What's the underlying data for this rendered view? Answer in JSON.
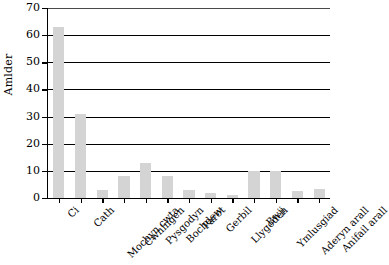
{
  "chart_data": {
    "type": "bar",
    "title": "",
    "xlabel": "",
    "ylabel": "Amlder",
    "ylim": [
      0,
      70
    ],
    "yticks": [
      0,
      10,
      20,
      30,
      40,
      50,
      60,
      70
    ],
    "grid": true,
    "legend": null,
    "bar_color": "#d4d4d4",
    "axis_color": "#000000",
    "categories": [
      "Ci",
      "Cath",
      "Mochyn cwta",
      "Cwningen",
      "Pysgodyn",
      "Bochdew",
      "Parot",
      "Gerbil",
      "Llygoden",
      "Bwji",
      "Ymlusgiad",
      "Aderyn arall",
      "Anifail arall"
    ],
    "values": [
      63,
      31,
      3,
      8,
      13,
      8,
      3,
      2,
      1,
      10,
      10,
      2.5,
      3.5
    ]
  }
}
